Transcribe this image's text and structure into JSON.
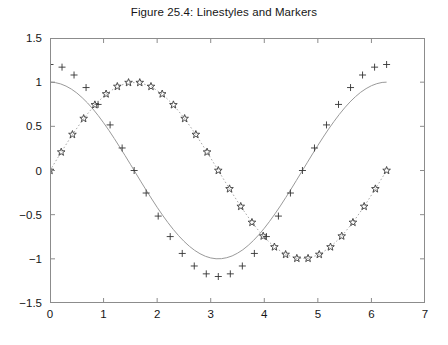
{
  "figure": {
    "title": "Figure 25.4: Linestyles and Markers",
    "background_color": "#ffffff",
    "axis_color": "#8c8c8c",
    "text_color": "#161616"
  },
  "chart_data": {
    "type": "line",
    "title": "Figure 25.4: Linestyles and Markers",
    "xlabel": "",
    "ylabel": "",
    "xlim": [
      0,
      7
    ],
    "ylim": [
      -1.5,
      1.5
    ],
    "xticks": [
      0,
      1,
      2,
      3,
      4,
      5,
      6,
      7
    ],
    "yticks": [
      -1.5,
      -1,
      -0.5,
      0,
      0.5,
      1,
      1.5
    ],
    "xtick_labels": [
      "0",
      "1",
      "2",
      "3",
      "4",
      "5",
      "6",
      "7"
    ],
    "ytick_labels": [
      "−1.5",
      "−1",
      "−0.5",
      "0",
      "0.5",
      "1",
      "1.5"
    ],
    "grid": false,
    "legend": "none",
    "box": true,
    "tick_direction": "in",
    "series": [
      {
        "name": "cos(x)",
        "linestyle": "solid",
        "marker": "none",
        "color": "#9a9a9a",
        "linewidth": 1,
        "x": [
          0.0,
          0.1,
          0.2,
          0.3,
          0.4,
          0.5,
          0.6,
          0.7,
          0.8,
          0.9,
          1.0,
          1.1,
          1.2,
          1.3,
          1.4,
          1.5,
          1.6,
          1.7,
          1.8,
          1.9,
          2.0,
          2.1,
          2.2,
          2.3,
          2.4,
          2.5,
          2.6,
          2.7,
          2.8,
          2.9,
          3.0,
          3.1,
          3.2,
          3.3,
          3.4,
          3.5,
          3.6,
          3.7,
          3.8,
          3.9,
          4.0,
          4.1,
          4.2,
          4.3,
          4.4,
          4.5,
          4.6,
          4.7,
          4.8,
          4.9,
          5.0,
          5.1,
          5.2,
          5.3,
          5.4,
          5.5,
          5.6,
          5.7,
          5.8,
          5.9,
          6.0,
          6.1,
          6.2,
          6.283
        ],
        "y": [
          1.0,
          0.995,
          0.98,
          0.955,
          0.921,
          0.878,
          0.825,
          0.765,
          0.697,
          0.622,
          0.54,
          0.454,
          0.362,
          0.267,
          0.17,
          0.071,
          -0.029,
          -0.129,
          -0.227,
          -0.323,
          -0.416,
          -0.505,
          -0.589,
          -0.666,
          -0.737,
          -0.801,
          -0.857,
          -0.904,
          -0.942,
          -0.971,
          -0.99,
          -0.999,
          -0.998,
          -0.987,
          -0.967,
          -0.936,
          -0.897,
          -0.848,
          -0.791,
          -0.726,
          -0.654,
          -0.575,
          -0.49,
          -0.401,
          -0.307,
          -0.211,
          -0.112,
          -0.012,
          0.087,
          0.187,
          0.284,
          0.378,
          0.469,
          0.554,
          0.635,
          0.709,
          0.776,
          0.835,
          0.886,
          0.927,
          0.96,
          0.983,
          0.997,
          1.0
        ]
      },
      {
        "name": "1.2*cos(x)",
        "linestyle": "none",
        "marker": "plus",
        "color": "#333333",
        "markersize": 7,
        "x": [
          0.0,
          0.2244,
          0.4488,
          0.6732,
          0.8976,
          1.122,
          1.3464,
          1.5708,
          1.7952,
          2.0196,
          2.244,
          2.4684,
          2.6928,
          2.9172,
          3.1416,
          3.366,
          3.5904,
          3.8148,
          4.0392,
          4.2636,
          4.488,
          4.7124,
          4.9368,
          5.1612,
          5.3856,
          5.61,
          5.8344,
          6.0588,
          6.2832
        ],
        "y": [
          1.2,
          1.17,
          1.081,
          0.939,
          0.748,
          0.516,
          0.255,
          0.0,
          -0.255,
          -0.516,
          -0.748,
          -0.939,
          -1.081,
          -1.17,
          -1.2,
          -1.17,
          -1.081,
          -0.939,
          -0.748,
          -0.516,
          -0.255,
          0.0,
          0.255,
          0.516,
          0.748,
          0.939,
          1.081,
          1.17,
          1.2
        ]
      },
      {
        "name": "sin(x)",
        "linestyle": "dotted",
        "marker": "pentagram",
        "color": "#3a3a3a",
        "markersize": 8,
        "x": [
          0.0,
          0.2094,
          0.4189,
          0.6283,
          0.8378,
          1.0472,
          1.2566,
          1.4661,
          1.6755,
          1.885,
          2.0944,
          2.3038,
          2.5133,
          2.7227,
          2.9322,
          3.1416,
          3.351,
          3.5605,
          3.7699,
          3.9794,
          4.1888,
          4.3982,
          4.6077,
          4.8171,
          5.0265,
          5.236,
          5.4454,
          5.6549,
          5.8643,
          6.0737,
          6.2832
        ],
        "y": [
          0.0,
          0.208,
          0.407,
          0.588,
          0.743,
          0.866,
          0.951,
          0.995,
          0.995,
          0.951,
          0.866,
          0.743,
          0.588,
          0.407,
          0.208,
          0.0,
          -0.208,
          -0.407,
          -0.588,
          -0.743,
          -0.866,
          -0.951,
          -0.995,
          -0.995,
          -0.951,
          -0.866,
          -0.743,
          -0.588,
          -0.407,
          -0.208,
          0.0
        ]
      }
    ]
  }
}
